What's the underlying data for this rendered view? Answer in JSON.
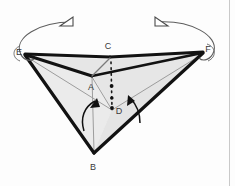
{
  "figure": {
    "canvas": {
      "width": 235,
      "height": 186
    },
    "background_color": "#fdfdfd",
    "face_fill_color": "#e9e9e9",
    "face_fill_color_light": "#f2f2f2",
    "outline_color": "#111111",
    "inner_edge_color": "#9a9a9a",
    "label_color": "#3a3a3a",
    "border_color": "#c8c8c8"
  },
  "vertices": [
    {
      "id": "E",
      "label": "E",
      "x": 25,
      "y": 53,
      "label_x": 19,
      "label_y": 52
    },
    {
      "id": "C",
      "label": "C",
      "x": 110,
      "y": 57,
      "label_x": 107,
      "label_y": 46
    },
    {
      "id": "F",
      "label": "F",
      "x": 203,
      "y": 52,
      "label_x": 208,
      "label_y": 50
    },
    {
      "id": "A",
      "label": "A",
      "x": 92,
      "y": 75,
      "label_x": 91,
      "label_y": 88
    },
    {
      "id": "D",
      "label": "D",
      "x": 112,
      "y": 110,
      "label_x": 118,
      "label_y": 113
    },
    {
      "id": "B",
      "label": "B",
      "x": 94,
      "y": 152,
      "label_x": 93,
      "label_y": 166
    }
  ],
  "edges": {
    "outer_thick": [
      "E-C",
      "C-F",
      "E-A",
      "A-C",
      "E-B",
      "B-F"
    ],
    "inner_thin": [
      "E-D",
      "D-F",
      "A-B",
      "C-A"
    ]
  },
  "dotted_line": {
    "from": "C",
    "to": "D",
    "style": "dotted"
  },
  "rotation_arrows": [
    {
      "id": "left-rotation-arrow",
      "around": "E",
      "direction": "counter-clockwise"
    },
    {
      "id": "right-rotation-arrow",
      "around": "F",
      "direction": "clockwise"
    }
  ],
  "fold_arrows": [
    {
      "id": "left-fold-arrow",
      "direction": "up"
    },
    {
      "id": "right-fold-arrow",
      "direction": "up"
    }
  ]
}
